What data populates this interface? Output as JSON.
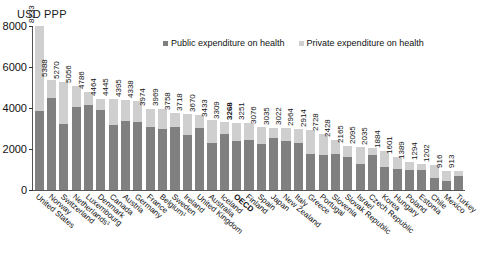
{
  "top_cut_text": "· · · · · · · · · · · · · · ·",
  "axis_unit_label": "USD PPP",
  "legend": {
    "public_label": "Public expenditure on health",
    "private_label": "Private expenditure on health"
  },
  "colors": {
    "public": "#808080",
    "private": "#cfcfcf",
    "axis": "#555555",
    "text": "#111111"
  },
  "chart_data": {
    "type": "bar",
    "title": "",
    "subtitle": "",
    "xlabel": "",
    "ylabel": "USD PPP",
    "ylim": [
      0,
      8000
    ],
    "yticks": [
      0,
      2000,
      4000,
      6000,
      8000
    ],
    "ytick_labels": [
      "0",
      "2000",
      "4000",
      "6000",
      "8000"
    ],
    "grid": false,
    "stacked": true,
    "legend_position": "top-center",
    "categories": [
      "United States",
      "Norway",
      "Switzerland",
      "Netherlands¹",
      "Luxembourg",
      "Denmark",
      "Canada",
      "Austria",
      "Germany",
      "France",
      "Belgium¹",
      "Sweden",
      "Ireland",
      "United Kingdom",
      "Australia",
      "Iceland",
      "OECD",
      "Finland",
      "Spain",
      "Japan",
      "New Zealand",
      "Italy",
      "Greece",
      "Portugal",
      "Slovenia",
      "Slovak Republic",
      "Israel",
      "Czech Republic",
      "Korea",
      "Hungary",
      "Poland",
      "Estonia",
      "Chile",
      "Mexico",
      "Turkey"
    ],
    "totals": [
      8233,
      5388,
      5270,
      5056,
      4786,
      4464,
      4445,
      4395,
      4338,
      3974,
      3969,
      3758,
      3718,
      3670,
      3433,
      3309,
      3268,
      3251,
      3076,
      3035,
      3022,
      2964,
      2914,
      2728,
      2428,
      2165,
      2095,
      2035,
      1884,
      1601,
      1389,
      1294,
      1202,
      916,
      913
    ],
    "total_labels": [
      "8233",
      "5388",
      "5270",
      "5056",
      "4786",
      "4464",
      "4445",
      "4395",
      "4338",
      "3974",
      "3969",
      "3758",
      "3718",
      "3670",
      "3433",
      "3309",
      "3268",
      "3251",
      "3076",
      "3035",
      "3022",
      "2964",
      "2914",
      "2728",
      "2428",
      "2165",
      "2095",
      "2035",
      "1884",
      "1601",
      "1389",
      "1294",
      "1202",
      "916",
      "913"
    ],
    "highlighted_category": "OECD",
    "series": [
      {
        "name": "Public expenditure on health",
        "color": "#808080",
        "values": [
          3967,
          4497,
          3227,
          4053,
          4168,
          3914,
          3181,
          3378,
          3331,
          3084,
          2976,
          3090,
          2680,
          3010,
          2300,
          2734,
          2377,
          2447,
          2259,
          2532,
          2372,
          2270,
          1761,
          1729,
          1761,
          1603,
          1290,
          1708,
          1111,
          1048,
          983,
          983,
          566,
          432,
          660
        ]
      },
      {
        "name": "Private expenditure on health",
        "color": "#cfcfcf",
        "values": [
          4266,
          891,
          2043,
          1003,
          618,
          550,
          1264,
          1017,
          1007,
          890,
          993,
          668,
          1038,
          660,
          1133,
          575,
          891,
          804,
          817,
          503,
          650,
          694,
          1153,
          999,
          667,
          562,
          805,
          327,
          773,
          553,
          406,
          311,
          636,
          484,
          253
        ]
      }
    ]
  }
}
